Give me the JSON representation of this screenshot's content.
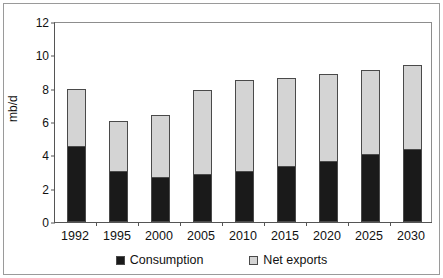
{
  "chart_data": {
    "type": "bar",
    "subtype": "stacked",
    "title": "",
    "xlabel": "",
    "ylabel": "mb/d",
    "ylim": [
      0,
      12
    ],
    "yticks": [
      0,
      2,
      4,
      6,
      8,
      10,
      12
    ],
    "ytick_labels": [
      "0",
      "2",
      "4",
      "6",
      "8",
      "10",
      "12"
    ],
    "grid": false,
    "legend_position": "bottom",
    "categories": [
      "1992",
      "1995",
      "2000",
      "2005",
      "2010",
      "2015",
      "2020",
      "2025",
      "2030"
    ],
    "series": [
      {
        "name": "Consumption",
        "color": "#1a1a1a",
        "values": [
          4.5,
          3.0,
          2.65,
          2.8,
          3.0,
          3.3,
          3.6,
          4.0,
          4.3
        ]
      },
      {
        "name": "Net exports",
        "color": "#d4d4d4",
        "values": [
          3.5,
          3.05,
          3.75,
          5.15,
          5.5,
          5.35,
          5.3,
          5.15,
          5.1
        ]
      }
    ],
    "totals": [
      8.0,
      6.05,
      6.4,
      7.95,
      8.5,
      8.65,
      8.9,
      9.15,
      9.4
    ]
  },
  "legend": {
    "entries": [
      {
        "label": "Consumption",
        "color": "#1a1a1a"
      },
      {
        "label": "Net exports",
        "color": "#d4d4d4"
      }
    ]
  }
}
